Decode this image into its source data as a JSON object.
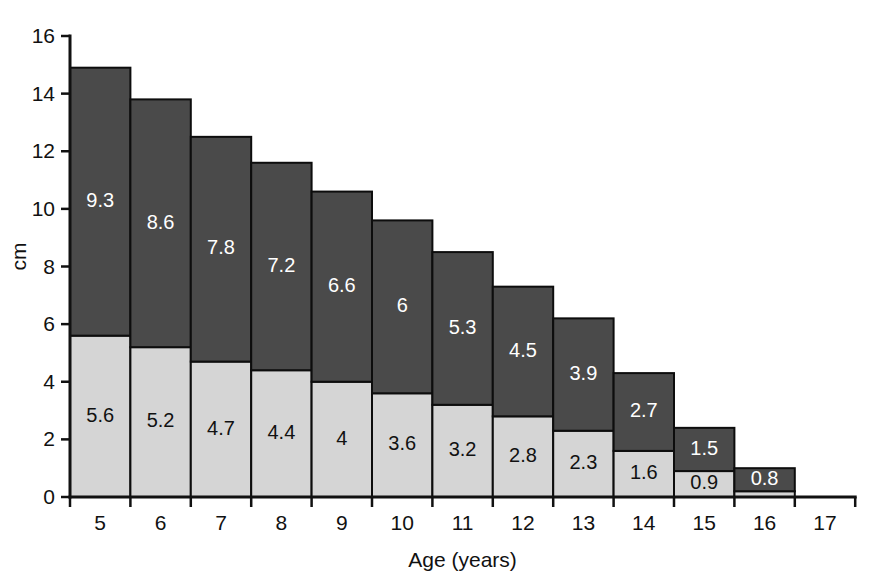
{
  "chart_data": {
    "type": "bar",
    "stacked": true,
    "title": "",
    "xlabel": "Age (years)",
    "ylabel": "cm",
    "categories": [
      "5",
      "6",
      "7",
      "8",
      "9",
      "10",
      "11",
      "12",
      "13",
      "14",
      "15",
      "16",
      "17"
    ],
    "x_tick_labels": [
      "5",
      "6",
      "7",
      "8",
      "9",
      "10",
      "11",
      "12",
      "13",
      "14",
      "15",
      "16",
      "17"
    ],
    "y_tick_labels": [
      "0",
      "2",
      "4",
      "6",
      "8",
      "10",
      "12",
      "14",
      "16"
    ],
    "y_ticks": [
      0,
      2,
      4,
      6,
      8,
      10,
      12,
      14,
      16
    ],
    "ylim": [
      0,
      16
    ],
    "grid": false,
    "legend": "none",
    "colors": {
      "lower_segment": "#d5d5d5",
      "upper_segment": "#4a4a4a",
      "axis": "#111111",
      "label_on_dark": "#ffffff",
      "label_on_light": "#111111",
      "background": "#ffffff"
    },
    "series": [
      {
        "name": "lower",
        "color": "#d5d5d5",
        "values": [
          5.6,
          5.2,
          4.7,
          4.4,
          4,
          3.6,
          3.2,
          2.8,
          2.3,
          1.6,
          0.9,
          0.2,
          null
        ],
        "labels": [
          "5.6",
          "5.2",
          "4.7",
          "4.4",
          "4",
          "3.6",
          "3.2",
          "2.8",
          "2.3",
          "1.6",
          "0.9",
          "",
          ""
        ]
      },
      {
        "name": "upper",
        "color": "#4a4a4a",
        "values": [
          9.3,
          8.6,
          7.8,
          7.2,
          6.6,
          6,
          5.3,
          4.5,
          3.9,
          2.7,
          1.5,
          0.8,
          null
        ],
        "labels": [
          "9.3",
          "8.6",
          "7.8",
          "7.2",
          "6.6",
          "6",
          "5.3",
          "4.5",
          "3.9",
          "2.7",
          "1.5",
          "0.8",
          ""
        ]
      }
    ],
    "totals": [
      14.9,
      13.8,
      12.5,
      11.6,
      10.6,
      9.6,
      8.5,
      7.3,
      6.2,
      4.3,
      2.4,
      1.0,
      null
    ]
  }
}
